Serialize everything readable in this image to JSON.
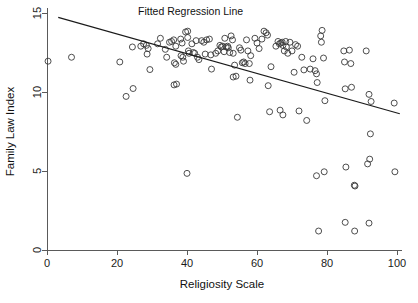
{
  "chart_data": {
    "type": "scatter",
    "title": "",
    "xlabel": "Religiosity Scale",
    "ylabel": "Family Law Index",
    "xlim": [
      0,
      100
    ],
    "ylim": [
      0,
      15
    ],
    "xticks": [
      0,
      20,
      40,
      60,
      80,
      100
    ],
    "yticks": [
      0,
      5,
      10,
      15
    ],
    "grid": false,
    "legend": "none",
    "annotations": [
      {
        "name": "fitted-regression-line-label",
        "text": "Fitted Regression Line",
        "x": 26,
        "y": 14.85
      }
    ],
    "series": [
      {
        "name": "Countries",
        "marker": "open-circle",
        "color": "#3a3a3a",
        "points": [
          [
            0.3,
            11.95
          ],
          [
            7.0,
            12.2
          ],
          [
            20.8,
            11.9
          ],
          [
            22.6,
            9.72
          ],
          [
            24.6,
            10.22
          ],
          [
            24.4,
            12.85
          ],
          [
            26.8,
            12.9
          ],
          [
            27.6,
            13.05
          ],
          [
            28.4,
            12.95
          ],
          [
            28.9,
            12.75
          ],
          [
            28.6,
            12.4
          ],
          [
            29.4,
            11.42
          ],
          [
            31.6,
            13.05
          ],
          [
            32.4,
            13.4
          ],
          [
            33.8,
            12.7
          ],
          [
            34.2,
            12.2
          ],
          [
            35.0,
            13.15
          ],
          [
            35.6,
            13.2
          ],
          [
            36.2,
            13.3
          ],
          [
            36.8,
            12.9
          ],
          [
            36.4,
            11.85
          ],
          [
            36.8,
            11.75
          ],
          [
            36.3,
            10.45
          ],
          [
            37.0,
            10.5
          ],
          [
            38.2,
            13.35
          ],
          [
            38.6,
            13.1
          ],
          [
            38.3,
            12.3
          ],
          [
            38.8,
            12.2
          ],
          [
            39.0,
            11.95
          ],
          [
            39.6,
            13.8
          ],
          [
            40.2,
            13.85
          ],
          [
            40.2,
            13.45
          ],
          [
            40.4,
            12.6
          ],
          [
            40.6,
            12.45
          ],
          [
            40.0,
            4.85
          ],
          [
            41.4,
            13.05
          ],
          [
            41.8,
            12.5
          ],
          [
            42.2,
            12.45
          ],
          [
            42.6,
            13.25
          ],
          [
            43.0,
            12.2
          ],
          [
            43.4,
            12.05
          ],
          [
            44.2,
            13.25
          ],
          [
            44.8,
            13.15
          ],
          [
            45.2,
            12.4
          ],
          [
            45.6,
            13.3
          ],
          [
            46.4,
            13.35
          ],
          [
            46.8,
            12.35
          ],
          [
            47.0,
            11.45
          ],
          [
            48.2,
            12.45
          ],
          [
            48.8,
            12.6
          ],
          [
            49.4,
            12.95
          ],
          [
            49.8,
            12.85
          ],
          [
            50.2,
            12.9
          ],
          [
            50.6,
            12.55
          ],
          [
            50.8,
            13.4
          ],
          [
            51.2,
            12.85
          ],
          [
            51.6,
            12.9
          ],
          [
            51.8,
            12.8
          ],
          [
            52.2,
            12.5
          ],
          [
            52.6,
            13.55
          ],
          [
            53.0,
            13.3
          ],
          [
            53.2,
            12.45
          ],
          [
            53.6,
            11.7
          ],
          [
            53.2,
            10.95
          ],
          [
            54.0,
            11.0
          ],
          [
            54.4,
            8.4
          ],
          [
            55.0,
            12.8
          ],
          [
            55.4,
            12.65
          ],
          [
            55.8,
            11.85
          ],
          [
            56.2,
            11.9
          ],
          [
            56.6,
            11.8
          ],
          [
            57.0,
            13.3
          ],
          [
            57.4,
            12.6
          ],
          [
            57.8,
            11.8
          ],
          [
            58.2,
            12.3
          ],
          [
            58.0,
            10.75
          ],
          [
            59.4,
            13.4
          ],
          [
            60.0,
            13.1
          ],
          [
            60.6,
            12.75
          ],
          [
            61.4,
            13.35
          ],
          [
            62.0,
            13.85
          ],
          [
            62.6,
            13.75
          ],
          [
            63.0,
            13.6
          ],
          [
            63.2,
            10.4
          ],
          [
            63.6,
            8.75
          ],
          [
            64.0,
            11.6
          ],
          [
            65.4,
            12.9
          ],
          [
            66.0,
            13.2
          ],
          [
            66.4,
            13.05
          ],
          [
            66.8,
            13.1
          ],
          [
            67.2,
            13.15
          ],
          [
            67.4,
            12.95
          ],
          [
            67.8,
            12.6
          ],
          [
            68.2,
            13.2
          ],
          [
            68.4,
            12.85
          ],
          [
            68.8,
            12.45
          ],
          [
            66.6,
            8.85
          ],
          [
            67.4,
            8.55
          ],
          [
            69.4,
            13.15
          ],
          [
            70.0,
            12.6
          ],
          [
            70.6,
            11.25
          ],
          [
            71.0,
            13.0
          ],
          [
            71.6,
            12.9
          ],
          [
            72.0,
            8.8
          ],
          [
            72.8,
            12.2
          ],
          [
            73.4,
            11.4
          ],
          [
            74.2,
            8.2
          ],
          [
            75.2,
            11.45
          ],
          [
            76.0,
            12.1
          ],
          [
            76.6,
            11.35
          ],
          [
            77.0,
            11.15
          ],
          [
            77.2,
            10.6
          ],
          [
            77.0,
            4.7
          ],
          [
            77.6,
            1.2
          ],
          [
            78.2,
            13.55
          ],
          [
            78.6,
            13.9
          ],
          [
            78.4,
            13.15
          ],
          [
            79.0,
            12.15
          ],
          [
            79.4,
            9.45
          ],
          [
            79.2,
            4.95
          ],
          [
            84.8,
            12.6
          ],
          [
            85.0,
            11.9
          ],
          [
            85.2,
            10.2
          ],
          [
            85.4,
            5.25
          ],
          [
            85.2,
            1.75
          ],
          [
            86.4,
            12.65
          ],
          [
            86.8,
            11.8
          ],
          [
            87.0,
            10.3
          ],
          [
            87.8,
            4.1
          ],
          [
            88.0,
            4.05
          ],
          [
            87.9,
            1.2
          ],
          [
            91.2,
            12.6
          ],
          [
            92.0,
            9.85
          ],
          [
            92.6,
            9.4
          ],
          [
            92.4,
            7.35
          ],
          [
            92.2,
            5.75
          ],
          [
            91.6,
            5.45
          ],
          [
            92.0,
            1.7
          ],
          [
            99.2,
            9.3
          ],
          [
            99.4,
            4.95
          ]
        ]
      }
    ],
    "fit_line": {
      "name": "Fitted Regression Line",
      "x_start": 3.2,
      "y_start": 14.72,
      "x_end": 100.8,
      "y_end": 8.62
    }
  }
}
